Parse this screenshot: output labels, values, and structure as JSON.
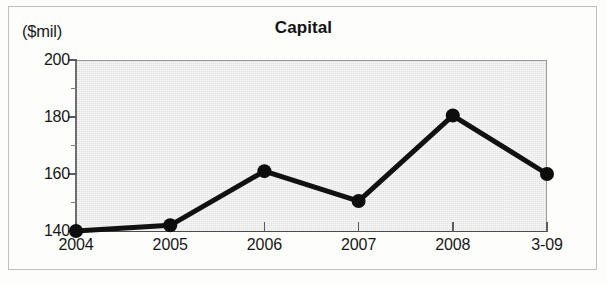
{
  "figure": {
    "unit_label": "($mil)",
    "title": "Capital"
  },
  "chart_data": {
    "type": "line",
    "title": "Capital",
    "subtitle": "",
    "xlabel": "",
    "ylabel": "($mil)",
    "categories": [
      "2004",
      "2005",
      "2006",
      "2007",
      "2008",
      "3-09"
    ],
    "values": [
      140,
      142,
      161,
      150.5,
      180.5,
      160
    ],
    "series": [
      {
        "name": "Capital",
        "values": [
          140,
          142,
          161,
          150.5,
          180.5,
          160
        ]
      }
    ],
    "ylim": [
      140,
      200
    ],
    "y_major_ticks": [
      140,
      160,
      180,
      200
    ],
    "y_minor_ticks": [
      150,
      170,
      190
    ],
    "y_tick_labels": [
      "140",
      "160",
      "180",
      "200"
    ],
    "x_tick_labels": [
      "2004",
      "2005",
      "2006",
      "2007",
      "2008",
      "3-09"
    ],
    "grid": false,
    "legend": false,
    "legend_position": "none",
    "marker": "filled-circle",
    "line_color": "#111111",
    "marker_color": "#0d0d0d",
    "plot_background": "#e2e2e2",
    "figure_background": "#fdfdfc",
    "annotations": []
  }
}
